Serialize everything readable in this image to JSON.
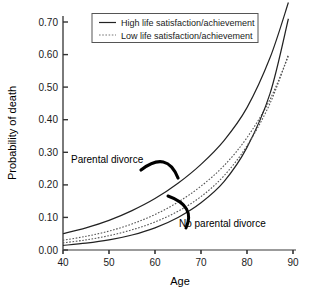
{
  "chart_data": {
    "type": "line",
    "title": "",
    "xlabel": "Age",
    "ylabel": "Probability of death",
    "xlim": [
      40,
      90
    ],
    "ylim": [
      0.0,
      0.75
    ],
    "grid": false,
    "x_ticks": [
      "40",
      "50",
      "60",
      "70",
      "80",
      "90"
    ],
    "x_tick_values": [
      40,
      50,
      60,
      70,
      80,
      90
    ],
    "y_ticks": [
      "0.00",
      "0.10",
      "0.20",
      "0.30",
      "0.40",
      "0.50",
      "0.60",
      "0.70"
    ],
    "y_tick_values": [
      0.0,
      0.1,
      0.2,
      0.3,
      0.4,
      0.5,
      0.6,
      0.7
    ],
    "x": [
      40,
      45,
      50,
      55,
      60,
      65,
      70,
      75,
      80,
      85,
      89
    ],
    "series": [
      {
        "name": "Parental divorce / High life satisfaction/achievement",
        "group": "Parental divorce",
        "style": "solid",
        "color": "#222222",
        "values": [
          0.05,
          0.068,
          0.091,
          0.121,
          0.158,
          0.205,
          0.263,
          0.336,
          0.437,
          0.59,
          0.76
        ]
      },
      {
        "name": "Parental divorce / Low life satisfaction/achievement",
        "group": "Parental divorce",
        "style": "dotted",
        "color": "#555555",
        "values": [
          0.03,
          0.042,
          0.058,
          0.08,
          0.109,
          0.147,
          0.196,
          0.259,
          0.345,
          0.462,
          0.595
        ]
      },
      {
        "name": "No parental divorce / High life satisfaction/achievement",
        "group": "No parental divorce",
        "style": "solid",
        "color": "#222222",
        "values": [
          0.014,
          0.021,
          0.031,
          0.046,
          0.068,
          0.1,
          0.145,
          0.21,
          0.315,
          0.48,
          0.71
        ]
      },
      {
        "name": "No parental divorce / Low life satisfaction/achievement",
        "group": "No parental divorce",
        "style": "dotted",
        "color": "#555555",
        "values": [
          0.022,
          0.031,
          0.044,
          0.062,
          0.086,
          0.119,
          0.164,
          0.228,
          0.32,
          0.45,
          0.6
        ]
      }
    ],
    "legend": {
      "position": "top-center",
      "entries": [
        {
          "label": "High life satisfaction/achievement",
          "style": "solid"
        },
        {
          "label": "Low life satisfaction/achievement",
          "style": "dotted"
        }
      ]
    },
    "annotations": [
      {
        "text": "Parental divorce",
        "x": 63,
        "y": 0.3
      },
      {
        "text": "No parental divorce",
        "x": 76,
        "y": 0.13
      }
    ]
  },
  "axis": {
    "x_title": "Age",
    "y_title": "Probability of death"
  }
}
